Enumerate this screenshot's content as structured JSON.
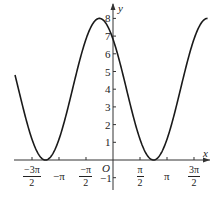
{
  "chart_data": {
    "type": "line",
    "title": "",
    "function": "y = 4 + 4cos(x + π/4)",
    "xlabel": "x",
    "ylabel": "y",
    "origin_label": "O",
    "x_ticks": [
      {
        "value": -4.712,
        "num": "−3π",
        "den": "2"
      },
      {
        "value": -3.1416,
        "label": "−π"
      },
      {
        "value": -1.5708,
        "num": "−π",
        "den": "2"
      },
      {
        "value": 1.5708,
        "num": "π",
        "den": "2"
      },
      {
        "value": 3.1416,
        "label": "π"
      },
      {
        "value": 4.712,
        "num": "3π",
        "den": "2"
      }
    ],
    "y_ticks": [
      -1,
      1,
      2,
      3,
      4,
      5,
      6,
      7,
      8
    ],
    "xlim": [
      -5.75,
      5.5
    ],
    "ylim": [
      -1.5,
      8.5
    ],
    "grid": false,
    "series": [
      {
        "name": "curve",
        "x_range": [
          -5.7,
          5.5
        ],
        "key_points": [
          {
            "x": -5.7,
            "y": 4.5
          },
          {
            "x": -3.927,
            "y": 0
          },
          {
            "x": -0.785,
            "y": 8
          },
          {
            "x": 0,
            "y": 6.83
          },
          {
            "x": 2.356,
            "y": 0
          },
          {
            "x": 5.498,
            "y": 8
          }
        ]
      }
    ]
  },
  "axes": {
    "x_label": "x",
    "y_label": "y",
    "origin": "O"
  }
}
